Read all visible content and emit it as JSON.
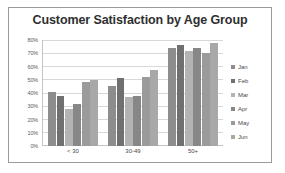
{
  "chart_data": {
    "type": "bar",
    "title": "Customer Satisfaction by Age Group",
    "xlabel": "",
    "ylabel": "",
    "categories": [
      "< 30",
      "30-49",
      "50+"
    ],
    "ylim": [
      0,
      80
    ],
    "ytick_labels": [
      "80%",
      "70%",
      "60%",
      "50%",
      "40%",
      "30%",
      "20%",
      "10%",
      "0%"
    ],
    "ytick_values": [
      80,
      70,
      60,
      50,
      40,
      30,
      20,
      10,
      0
    ],
    "grid": true,
    "legend_position": "right",
    "series": [
      {
        "name": "Jan",
        "color": "#8d8d8d",
        "values": [
          41,
          45,
          74
        ]
      },
      {
        "name": "Feb",
        "color": "#707070",
        "values": [
          38,
          51,
          76
        ]
      },
      {
        "name": "Mar",
        "color": "#b3b3b3",
        "values": [
          28,
          37,
          72
        ]
      },
      {
        "name": "Apr",
        "color": "#878787",
        "values": [
          32,
          38,
          74
        ]
      },
      {
        "name": "May",
        "color": "#9b9b9b",
        "values": [
          48,
          52,
          70
        ]
      },
      {
        "name": "Jun",
        "color": "#a8a8a8",
        "values": [
          50,
          57,
          78
        ]
      }
    ]
  }
}
